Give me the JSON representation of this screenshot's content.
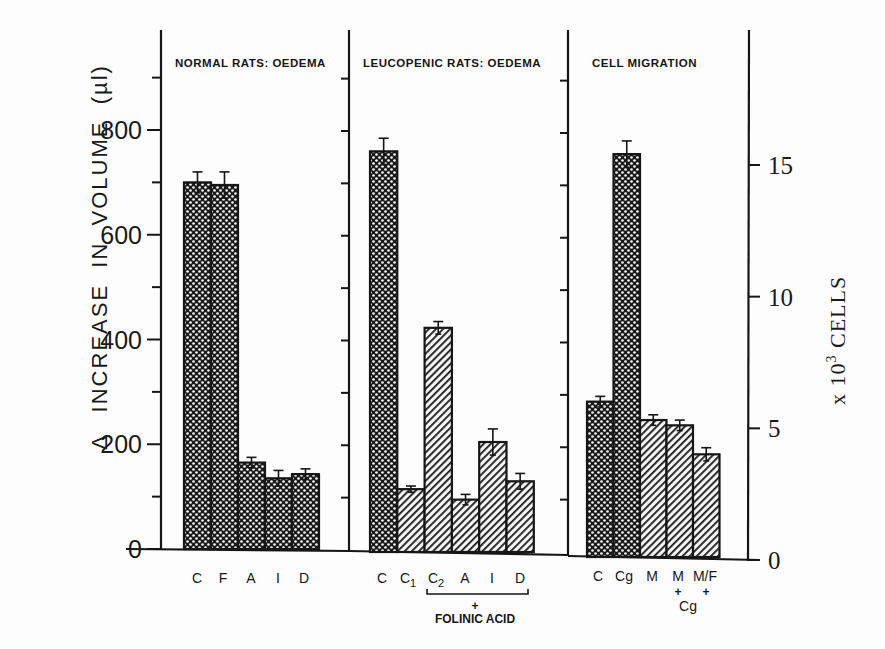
{
  "chart_data": [
    {
      "type": "bar",
      "panel": "left",
      "title": "NORMAL RATS: OEDEMA",
      "axis": "left",
      "ylabel": "Δ INCREASE IN VOLUME (µl)",
      "ylim": [
        0,
        950
      ],
      "yticks": [
        0,
        200,
        400,
        600,
        800
      ],
      "categories": [
        "C",
        "F",
        "A",
        "I",
        "D"
      ],
      "values": [
        700,
        695,
        165,
        135,
        143
      ],
      "errors": [
        20,
        25,
        10,
        15,
        10
      ],
      "patterns": [
        "crosshatch",
        "crosshatch",
        "crosshatch",
        "crosshatch",
        "crosshatch"
      ]
    },
    {
      "type": "bar",
      "panel": "middle",
      "title": "LEUCOPENIC RATS: OEDEMA",
      "axis": "left",
      "ylabel": "Δ INCREASE IN VOLUME (µl)",
      "ylim": [
        0,
        950
      ],
      "categories": [
        "C",
        "C1",
        "C2",
        "A",
        "I",
        "D"
      ],
      "values": [
        765,
        120,
        428,
        100,
        210,
        135
      ],
      "errors": [
        25,
        6,
        12,
        10,
        25,
        15
      ],
      "patterns": [
        "crosshatch",
        "diagonal",
        "diagonal",
        "diagonal",
        "diagonal",
        "diagonal"
      ],
      "annotation": "C2 – D + FOLINIC ACID"
    },
    {
      "type": "bar",
      "panel": "right",
      "title": "CELL MIGRATION",
      "axis": "right",
      "ylabel": "x 10³ CELLS",
      "ylim": [
        0,
        20
      ],
      "yticks": [
        0,
        5,
        10,
        15
      ],
      "categories": [
        "C",
        "Cg",
        "M",
        "M + Cg",
        "M/F + Cg"
      ],
      "values": [
        5.9,
        15.3,
        5.2,
        5.0,
        3.9
      ],
      "errors": [
        0.2,
        0.5,
        0.2,
        0.2,
        0.25
      ],
      "patterns": [
        "crosshatch",
        "crosshatch",
        "diagonal",
        "diagonal",
        "diagonal"
      ]
    }
  ],
  "axes": {
    "left": {
      "title_delta": "Δ",
      "title_text": "INCREASE  IN  VOLUME  (µl)",
      "ticks": [
        "0",
        "200",
        "400",
        "600",
        "800"
      ]
    },
    "right": {
      "title_prefix": "x 10",
      "title_sup": "3",
      "title_suffix": " CELLS",
      "ticks": [
        "0",
        "5",
        "10",
        "15"
      ]
    }
  },
  "panels": {
    "normal": {
      "title": "NORMAL RATS: OEDEMA",
      "labels": [
        "C",
        "F",
        "A",
        "I",
        "D"
      ]
    },
    "leucopenic": {
      "title": "LEUCOPENIC RATS: OEDEMA",
      "labels": [
        "C",
        "C",
        "C",
        "A",
        "I",
        "D"
      ],
      "subscripts": [
        "",
        "1",
        "2",
        "",
        "",
        ""
      ],
      "bracket_plus": "+",
      "bracket_note": "FOLINIC ACID"
    },
    "migration": {
      "title": "CELL MIGRATION",
      "labels": [
        "C",
        "Cg",
        "M",
        "M",
        "M/F"
      ],
      "plus": "+",
      "cg_note": "Cg"
    }
  },
  "colors": {
    "ink": "#161616",
    "background": "#fdfdfd"
  }
}
